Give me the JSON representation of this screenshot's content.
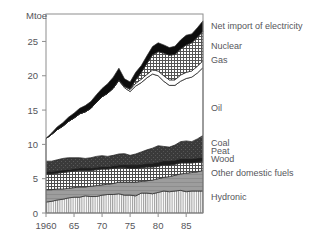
{
  "chart_data": {
    "type": "area",
    "title": "",
    "subtitle": "",
    "xlabel": "",
    "ylabel": "Mtoe",
    "unit_label": "Mtoe",
    "xlim": [
      1960,
      1988
    ],
    "ylim": [
      0,
      29
    ],
    "grid": false,
    "legend_position": "right-inline",
    "stacked": true,
    "x_tick_labels": [
      "1960",
      "65",
      "70",
      "75",
      "80",
      "85"
    ],
    "x_ticks": [
      1960,
      1965,
      1970,
      1975,
      1980,
      1985
    ],
    "y_tick_labels": [
      "0",
      "5",
      "10",
      "15",
      "20",
      "25"
    ],
    "y_ticks": [
      0,
      5,
      10,
      15,
      20,
      25
    ],
    "x": [
      1960,
      1961,
      1962,
      1963,
      1964,
      1965,
      1966,
      1967,
      1968,
      1969,
      1970,
      1971,
      1972,
      1973,
      1974,
      1975,
      1976,
      1977,
      1978,
      1979,
      1980,
      1981,
      1982,
      1983,
      1984,
      1985,
      1986,
      1987,
      1988
    ],
    "series": [
      {
        "name": "Hydronic",
        "pattern": "vertical-lines",
        "color": "#d5d5d5",
        "values": [
          1.6,
          1.7,
          1.9,
          2.0,
          2.2,
          2.3,
          2.3,
          2.5,
          2.4,
          2.4,
          2.6,
          2.7,
          2.7,
          2.8,
          2.6,
          2.6,
          2.5,
          2.9,
          2.9,
          2.8,
          3.0,
          3.2,
          3.1,
          3.2,
          3.3,
          3.1,
          3.2,
          3.2,
          3.2
        ]
      },
      {
        "name": "Other domestic fuels",
        "pattern": "solid-gray",
        "color": "#a0a0a0",
        "values": [
          1.8,
          1.7,
          1.6,
          1.5,
          1.4,
          1.4,
          1.5,
          1.3,
          1.5,
          1.6,
          1.5,
          1.5,
          1.6,
          1.7,
          1.9,
          1.9,
          2.0,
          1.7,
          1.8,
          2.0,
          2.0,
          2.0,
          2.2,
          2.3,
          2.4,
          2.7,
          2.7,
          2.8,
          3.0
        ]
      },
      {
        "name": "Wood",
        "pattern": "cross-hatch",
        "color": "#e8e8e8",
        "values": [
          2.3,
          2.3,
          2.3,
          2.4,
          2.4,
          2.4,
          2.4,
          2.4,
          2.3,
          2.3,
          2.3,
          2.2,
          2.2,
          2.1,
          2.1,
          2.0,
          2.0,
          2.0,
          2.0,
          1.9,
          1.8,
          1.8,
          1.7,
          1.6,
          1.6,
          1.5,
          1.4,
          1.4,
          1.3
        ]
      },
      {
        "name": "Peat",
        "pattern": "dark-solid",
        "color": "#2b2b2b",
        "values": [
          0.35,
          0.35,
          0.35,
          0.35,
          0.35,
          0.35,
          0.35,
          0.35,
          0.35,
          0.35,
          0.35,
          0.35,
          0.4,
          0.4,
          0.45,
          0.5,
          0.5,
          0.5,
          0.5,
          0.55,
          0.6,
          0.6,
          0.6,
          0.6,
          0.6,
          0.6,
          0.6,
          0.6,
          0.6
        ]
      },
      {
        "name": "Coal",
        "pattern": "dark-mottled",
        "color": "#3c3c3c",
        "values": [
          1.5,
          1.5,
          1.6,
          1.7,
          1.7,
          1.6,
          1.5,
          1.4,
          1.5,
          1.6,
          1.6,
          1.5,
          1.5,
          1.6,
          1.6,
          1.4,
          1.6,
          1.8,
          2.0,
          2.2,
          2.4,
          2.1,
          2.0,
          2.2,
          2.5,
          2.6,
          2.5,
          2.8,
          3.2
        ]
      },
      {
        "name": "Oil",
        "pattern": "white",
        "color": "#ffffff",
        "values": [
          3.3,
          3.9,
          4.4,
          4.7,
          5.3,
          5.8,
          6.4,
          6.8,
          7.2,
          7.9,
          8.6,
          9.2,
          9.8,
          10.7,
          9.6,
          9.3,
          9.9,
          10.1,
          10.5,
          10.8,
          10.2,
          9.5,
          9.0,
          8.7,
          8.8,
          9.1,
          9.4,
          9.6,
          9.9
        ]
      },
      {
        "name": "Gas",
        "pattern": "thin-white",
        "color": "#fafafa",
        "values": [
          0.0,
          0.0,
          0.0,
          0.0,
          0.0,
          0.0,
          0.0,
          0.0,
          0.0,
          0.0,
          0.0,
          0.0,
          0.0,
          0.1,
          0.2,
          0.3,
          0.4,
          0.5,
          0.5,
          0.6,
          0.7,
          0.8,
          0.8,
          0.8,
          0.9,
          0.9,
          0.9,
          1.0,
          1.0
        ]
      },
      {
        "name": "Nuclear",
        "pattern": "cross-hatch",
        "color": "#e0e0e0",
        "values": [
          0.0,
          0.0,
          0.0,
          0.0,
          0.0,
          0.0,
          0.0,
          0.0,
          0.0,
          0.0,
          0.0,
          0.0,
          0.0,
          0.0,
          0.0,
          0.1,
          0.5,
          1.0,
          1.6,
          2.2,
          2.8,
          3.3,
          3.6,
          3.7,
          3.8,
          4.0,
          4.1,
          4.2,
          4.3
        ]
      },
      {
        "name": "Net import of electricity",
        "pattern": "black-solid",
        "color": "#111111",
        "values": [
          0.0,
          0.2,
          0.4,
          0.5,
          0.6,
          0.7,
          0.8,
          0.9,
          1.0,
          1.1,
          1.2,
          1.4,
          1.6,
          1.7,
          1.1,
          1.0,
          1.1,
          1.0,
          1.1,
          1.2,
          1.3,
          1.2,
          1.1,
          1.2,
          1.3,
          1.4,
          1.3,
          1.4,
          1.5
        ]
      }
    ],
    "totals": [
      10.85,
      11.65,
      12.55,
      13.15,
      13.95,
      14.55,
      15.25,
      15.65,
      16.25,
      17.25,
      18.15,
      18.85,
      19.8,
      21.1,
      19.55,
      19.1,
      20.5,
      21.5,
      22.9,
      24.25,
      24.8,
      24.5,
      24.1,
      24.3,
      25.2,
      25.9,
      26.1,
      27.0,
      28.0
    ],
    "legend_labels": [
      {
        "label": "Net import of electricity",
        "y_value": 27.3
      },
      {
        "label": "Nuclear",
        "y_value": 24.4
      },
      {
        "label": "Gas",
        "y_value": 22.3
      },
      {
        "label": "Oil",
        "y_value": 15.4
      },
      {
        "label": "Coal",
        "y_value": 10.2
      },
      {
        "label": "Peat",
        "y_value": 9.1
      },
      {
        "label": "Wood",
        "y_value": 7.9
      },
      {
        "label": "Other domestic fuels",
        "y_value": 5.9
      },
      {
        "label": "Hydronic",
        "y_value": 2.4
      }
    ]
  }
}
